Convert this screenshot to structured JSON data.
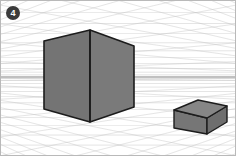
{
  "figure": {
    "title": "Two-point perspective construction grid with two cubes",
    "badge_label": "4",
    "canvas": {
      "width": 236,
      "height": 156
    },
    "frame": {
      "stroke": "#b9b9b9",
      "stroke_width": 1,
      "fill": "#ffffff"
    },
    "horizon": {
      "label": "horizon line",
      "y": 77,
      "stroke": "#9a9a9a",
      "stroke_width": 1.1
    },
    "vanishing_points": [
      {
        "name": "left-vanishing-point",
        "x": -150,
        "y": 77
      },
      {
        "name": "right-vanishing-point",
        "x": 392,
        "y": 77
      }
    ],
    "grid": {
      "stroke": "#c2c2c2",
      "stroke_width": 0.45,
      "opacity": 0.95,
      "left_fan_count": 26,
      "right_fan_count": 26,
      "ground_rows": 13,
      "sky_rows": 11,
      "fan_span_top": -210,
      "fan_span_bottom": 330
    },
    "objects": [
      {
        "name": "large-cube",
        "label": "Large cube (near)",
        "faces": {
          "left_face": {
            "label": "left face",
            "fill": "#747474",
            "points": "44,41 90,30 90,122 44,109"
          },
          "right_face": {
            "label": "right face",
            "fill": "#7a7a7a",
            "points": "90,30 134,46 134,107 90,122"
          }
        },
        "outline_stroke": "#1c1c1c",
        "outline_width": 1.6,
        "vertical_edge": {
          "x1": 90,
          "y1": 30,
          "x2": 90,
          "y2": 122
        }
      },
      {
        "name": "small-cube",
        "label": "Small cube (far)",
        "faces": {
          "top_face": {
            "label": "top face",
            "fill": "#868686",
            "points": "174,110 198,100 227,106 207,118"
          },
          "left_face": {
            "label": "left face",
            "fill": "#767676",
            "points": "174,110 207,118 207,134 174,128"
          },
          "right_face": {
            "label": "right face",
            "fill": "#6e6e6e",
            "points": "207,118 227,106 227,122 207,134"
          }
        },
        "outline_stroke": "#1c1c1c",
        "outline_width": 1.4
      }
    ]
  }
}
